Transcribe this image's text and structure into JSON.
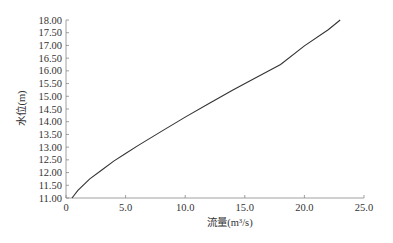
{
  "chart_data": {
    "type": "line",
    "title": "",
    "xlabel": "流量(m³/s)",
    "ylabel": "水位(m)",
    "xlim": [
      0,
      25
    ],
    "ylim": [
      11.0,
      18.0
    ],
    "x_ticks": [
      "0",
      "5.0",
      "10.0",
      "15.0",
      "20.0",
      "25.0"
    ],
    "y_ticks": [
      "11.00",
      "11.50",
      "12.00",
      "12.50",
      "13.00",
      "13.50",
      "14.00",
      "14.50",
      "15.00",
      "15.50",
      "16.00",
      "16.50",
      "17.00",
      "17.50",
      "18.00"
    ],
    "grid": false,
    "legend": null,
    "series": [
      {
        "name": "水位-流量关系",
        "color": "#333333",
        "x": [
          0.5,
          1.0,
          2.0,
          3.0,
          4.0,
          5.0,
          6.0,
          8.0,
          10.0,
          12.0,
          14.0,
          16.0,
          18.0,
          20.0,
          22.0,
          23.0
        ],
        "y": [
          11.0,
          11.3,
          11.75,
          12.1,
          12.45,
          12.75,
          13.05,
          13.62,
          14.18,
          14.72,
          15.25,
          15.75,
          16.25,
          16.98,
          17.62,
          18.0
        ]
      }
    ]
  }
}
